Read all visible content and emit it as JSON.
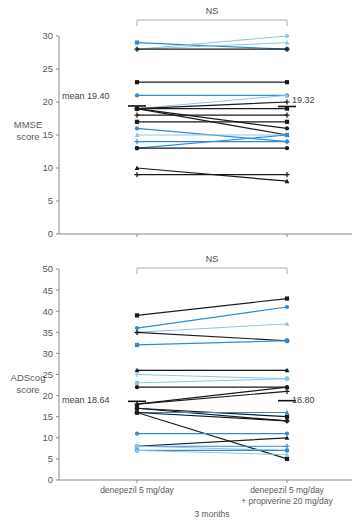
{
  "figure": {
    "background": "#ffffff",
    "colors": {
      "black": "#1a1a1a",
      "blue": "#2e8bd4",
      "light_blue": "#8ec4e8",
      "axis": "#8a8a8a",
      "text": "#5a5a5a",
      "bracket": "#b0b0b0"
    },
    "shared_xlabel": "3 months",
    "categories": [
      "denepezil 5 mg/day",
      "denepezil 5 mg/day",
      "+ propiverine 20 mg/day"
    ]
  },
  "chart_data": [
    {
      "type": "line",
      "id": "mmse",
      "title": "",
      "significance_label": "NS",
      "ylabel": "MMSE score",
      "ylabel_line1": "MMSE",
      "ylabel_line2": "score",
      "xlabel": "3 months",
      "ylim": [
        0,
        30
      ],
      "yticks": [
        0,
        5,
        10,
        15,
        20,
        25,
        30
      ],
      "ytick_labels": [
        "0",
        "5",
        "10",
        "15",
        "20",
        "25",
        "30"
      ],
      "categories": [
        "denepezil 5 mg/day",
        "denepezil 5 mg/day + propiverine 20 mg/day"
      ],
      "grid": false,
      "legend": "none",
      "mean_left": 19.4,
      "mean_right": 19.32,
      "mean_left_label": "mean 19.40",
      "mean_right_label": "19.32",
      "series": [
        {
          "name": "p1",
          "color": "blue",
          "values": [
            29,
            28
          ]
        },
        {
          "name": "p2",
          "color": "light_blue",
          "values": [
            28,
            30
          ]
        },
        {
          "name": "p3",
          "color": "light_blue",
          "values": [
            28,
            29
          ]
        },
        {
          "name": "p4",
          "color": "black",
          "values": [
            28,
            28
          ]
        },
        {
          "name": "p5",
          "color": "black",
          "values": [
            23,
            23
          ]
        },
        {
          "name": "p6",
          "color": "blue",
          "values": [
            21,
            21
          ]
        },
        {
          "name": "p7",
          "color": "light_blue",
          "values": [
            19,
            21
          ]
        },
        {
          "name": "p8",
          "color": "black",
          "values": [
            19,
            20
          ]
        },
        {
          "name": "p9",
          "color": "black",
          "values": [
            19,
            19
          ]
        },
        {
          "name": "p10",
          "color": "black",
          "values": [
            19,
            16
          ]
        },
        {
          "name": "p11",
          "color": "black",
          "values": [
            19,
            15
          ]
        },
        {
          "name": "p12",
          "color": "black",
          "values": [
            18,
            18
          ]
        },
        {
          "name": "p13",
          "color": "black",
          "values": [
            17,
            17
          ]
        },
        {
          "name": "p14",
          "color": "blue",
          "values": [
            16,
            14
          ]
        },
        {
          "name": "p15",
          "color": "light_blue",
          "values": [
            15,
            15
          ]
        },
        {
          "name": "p16",
          "color": "blue",
          "values": [
            14,
            14
          ]
        },
        {
          "name": "p17",
          "color": "blue",
          "values": [
            13,
            15
          ]
        },
        {
          "name": "p18",
          "color": "black",
          "values": [
            13,
            13
          ]
        },
        {
          "name": "p19",
          "color": "black",
          "values": [
            10,
            8
          ]
        },
        {
          "name": "p20",
          "color": "black",
          "values": [
            9,
            9
          ]
        }
      ]
    },
    {
      "type": "line",
      "id": "adascog",
      "title": "",
      "significance_label": "NS",
      "ylabel": "ADScog score",
      "ylabel_line1": "ADScog",
      "ylabel_line2": "score",
      "xlabel": "3 months",
      "ylim": [
        0,
        50
      ],
      "yticks": [
        0,
        5,
        10,
        15,
        20,
        25,
        30,
        35,
        40,
        45,
        50
      ],
      "ytick_labels": [
        "0",
        "5",
        "10",
        "15",
        "20",
        "25",
        "30",
        "35",
        "40",
        "45",
        "50"
      ],
      "categories": [
        "denepezil 5 mg/day",
        "denepezil 5 mg/day + propiverine 20 mg/day"
      ],
      "grid": false,
      "legend": "none",
      "mean_left": 18.64,
      "mean_right": 18.8,
      "mean_left_label": "mean 18.64",
      "mean_right_label": "18.80",
      "series": [
        {
          "name": "q1",
          "color": "black",
          "values": [
            39,
            43
          ]
        },
        {
          "name": "q2",
          "color": "blue",
          "values": [
            36,
            41
          ]
        },
        {
          "name": "q3",
          "color": "light_blue",
          "values": [
            35,
            37
          ]
        },
        {
          "name": "q4",
          "color": "black",
          "values": [
            35,
            33
          ]
        },
        {
          "name": "q5",
          "color": "blue",
          "values": [
            32,
            33
          ]
        },
        {
          "name": "q6",
          "color": "light_blue",
          "values": [
            26,
            26
          ]
        },
        {
          "name": "q7",
          "color": "black",
          "values": [
            26,
            26
          ]
        },
        {
          "name": "q8",
          "color": "light_blue",
          "values": [
            25,
            24
          ]
        },
        {
          "name": "q9",
          "color": "light_blue",
          "values": [
            23,
            24
          ]
        },
        {
          "name": "q10",
          "color": "black",
          "values": [
            22,
            22
          ]
        },
        {
          "name": "q11",
          "color": "black",
          "values": [
            18,
            22
          ]
        },
        {
          "name": "q12",
          "color": "black",
          "values": [
            18,
            21
          ]
        },
        {
          "name": "q13",
          "color": "black",
          "values": [
            17,
            15
          ]
        },
        {
          "name": "q14",
          "color": "black",
          "values": [
            17,
            14
          ]
        },
        {
          "name": "q15",
          "color": "blue",
          "values": [
            16,
            16
          ]
        },
        {
          "name": "q16",
          "color": "black",
          "values": [
            16,
            14
          ]
        },
        {
          "name": "q17",
          "color": "black",
          "values": [
            16,
            5
          ]
        },
        {
          "name": "q18",
          "color": "blue",
          "values": [
            11,
            11
          ]
        },
        {
          "name": "q19",
          "color": "black",
          "values": [
            8,
            10
          ]
        },
        {
          "name": "q20",
          "color": "blue",
          "values": [
            8,
            8
          ]
        },
        {
          "name": "q21",
          "color": "light_blue",
          "values": [
            8,
            7
          ]
        },
        {
          "name": "q22",
          "color": "blue",
          "values": [
            7,
            7
          ]
        },
        {
          "name": "q23",
          "color": "light_blue",
          "values": [
            7,
            6
          ]
        }
      ]
    }
  ]
}
